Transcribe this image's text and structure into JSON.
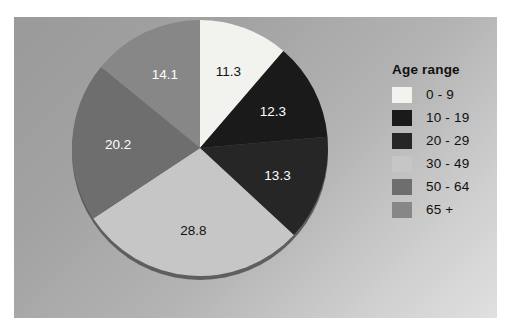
{
  "figure": {
    "background_color": "#ffffff",
    "panel_gradient_from": "#9a9a9a",
    "panel_gradient_to": "#e0e0e0"
  },
  "legend": {
    "title": "Age range",
    "items": [
      {
        "label": "0 - 9",
        "color": "#f2f2ef"
      },
      {
        "label": "10 - 19",
        "color": "#1a1a1a"
      },
      {
        "label": "20 - 29",
        "color": "#262626"
      },
      {
        "label": "30 - 49",
        "color": "#c6c6c6"
      },
      {
        "label": "50 - 64",
        "color": "#6e6e6e"
      },
      {
        "label": "65 +",
        "color": "#878787"
      }
    ]
  },
  "chart_data": {
    "type": "pie",
    "title": "",
    "legend_title": "Age range",
    "legend_position": "right",
    "start_angle_deg": 0,
    "direction": "clockwise",
    "categories": [
      "0 - 9",
      "10 - 19",
      "20 - 29",
      "30 - 49",
      "50 - 64",
      "65 +"
    ],
    "values": [
      11.3,
      12.3,
      13.3,
      28.8,
      20.2,
      14.1
    ],
    "labels": [
      "11.3",
      "12.3",
      "13.3",
      "28.8",
      "20.2",
      "14.1"
    ],
    "colors": [
      "#f2f2ef",
      "#1a1a1a",
      "#262626",
      "#c6c6c6",
      "#6e6e6e",
      "#878787"
    ],
    "label_text_colors": [
      "#111111",
      "#ffffff",
      "#ffffff",
      "#111111",
      "#ffffff",
      "#ffffff"
    ],
    "total": 100.0,
    "units": "percent"
  }
}
